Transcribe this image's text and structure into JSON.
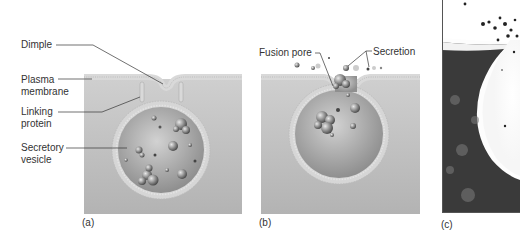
{
  "figure": {
    "panels": [
      {
        "id": "a",
        "label": "(a)",
        "annotations": [
          "Dimple",
          "Plasma\nmembrane",
          "Linking\nprotein",
          "Secretory\nvesicle"
        ]
      },
      {
        "id": "b",
        "label": "(b)",
        "annotations": [
          "Fusion pore",
          "Secretion"
        ]
      },
      {
        "id": "c",
        "label": "(c)",
        "annotations": []
      }
    ]
  },
  "colors": {
    "background_panel": "#b9b9b9",
    "membrane": "#d8d8d8",
    "vesicle_interior": "#a8a8a8",
    "leader_line": "#333333"
  }
}
